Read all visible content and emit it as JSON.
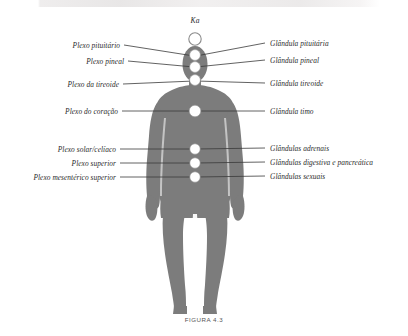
{
  "figure": {
    "caption": "FIGURA 4.3",
    "crown_label": "Ka",
    "colors": {
      "body_fill": "#7c7c7c",
      "body_fill_dark": "#6e6e6e",
      "node_fill": "#ffffff",
      "node_stroke": "#8a8a8a",
      "leader_line": "#3a3a3a",
      "text": "#2b2b2b",
      "background": "#ffffff"
    }
  },
  "left_labels": [
    {
      "text": "Plexo pituitário",
      "y": 45,
      "x_end": 196,
      "node": "pituitary"
    },
    {
      "text": "Plexo pineal",
      "y": 61,
      "x_end": 196,
      "node": "pineal"
    },
    {
      "text": "Plexo da tireoide",
      "y": 84,
      "x_end": 196,
      "node": "thyroid"
    },
    {
      "text": "Plexo do coração",
      "y": 111,
      "x_end": 196,
      "node": "heart"
    },
    {
      "text": "Plexo solar/celíaco",
      "y": 149,
      "x_end": 196,
      "node": "solar"
    },
    {
      "text": "Plexo superior",
      "y": 163,
      "x_end": 196,
      "node": "superior"
    },
    {
      "text": "Plexo mesentérico superior",
      "y": 177,
      "x_end": 196,
      "node": "mesenteric"
    }
  ],
  "right_labels": [
    {
      "text": "Glândula pituitária",
      "y": 45,
      "x_start": 196,
      "node": "pituitary"
    },
    {
      "text": "Glândula pineal",
      "y": 62,
      "x_start": 196,
      "node": "pineal"
    },
    {
      "text": "Glândula tireoide",
      "y": 84,
      "x_start": 196,
      "node": "thyroid"
    },
    {
      "text": "Glândula timo",
      "y": 111,
      "x_start": 196,
      "node": "heart"
    },
    {
      "text": "Glândulas adrenais",
      "y": 149,
      "x_start": 196,
      "node": "solar"
    },
    {
      "text": "Glândulas digestiva e pancreática",
      "y": 163,
      "x_start": 196,
      "node": "superior"
    },
    {
      "text": "Glândulas sexuais",
      "y": 177,
      "x_start": 196,
      "node": "mesenteric"
    }
  ],
  "nodes": [
    {
      "name": "ka",
      "cx": 195,
      "cy": 39,
      "r": 6.2,
      "filled": false
    },
    {
      "name": "pituitary",
      "cx": 195,
      "cy": 55,
      "r": 5.4,
      "filled": true
    },
    {
      "name": "pineal",
      "cx": 195,
      "cy": 67,
      "r": 5.4,
      "filled": true
    },
    {
      "name": "thyroid",
      "cx": 195,
      "cy": 80,
      "r": 5.4,
      "filled": true
    },
    {
      "name": "heart",
      "cx": 195,
      "cy": 111,
      "r": 5.8,
      "filled": true
    },
    {
      "name": "solar",
      "cx": 195,
      "cy": 149,
      "r": 5.2,
      "filled": true
    },
    {
      "name": "superior",
      "cx": 195,
      "cy": 163,
      "r": 5.2,
      "filled": true
    },
    {
      "name": "mesenteric",
      "cx": 195,
      "cy": 177,
      "r": 5.2,
      "filled": true
    }
  ]
}
